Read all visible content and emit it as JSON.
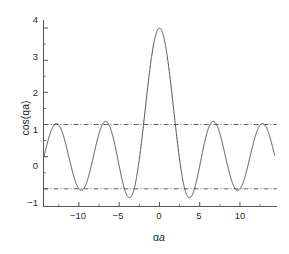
{
  "chart_data": {
    "type": "line",
    "title": "",
    "subtitle": "",
    "xlabel": "αa",
    "xlabel_symbol": "α",
    "xlabel_var": "a",
    "ylabel": "cos(qa)",
    "xlim": [
      -14.4,
      14.6
    ],
    "ylim": [
      -1.55,
      4.25
    ],
    "xticks": [
      -10,
      -5,
      0,
      5,
      10
    ],
    "xtick_labels": [
      "−10",
      "−5",
      "0",
      "5",
      "10"
    ],
    "yticks": [
      -1,
      0,
      1,
      2,
      3,
      4
    ],
    "ytick_labels": [
      "−1",
      "0",
      "1",
      "2",
      "3",
      "4"
    ],
    "minor_xticks": [
      -12.5,
      -7.5,
      -2.5,
      2.5,
      7.5,
      12.5
    ],
    "minor_yticks": [
      -0.5,
      0.5,
      1.5,
      2.5,
      3.5
    ],
    "grid": false,
    "legend": "none",
    "series": [
      {
        "name": "P sin(αa)/(αa) + cos(αa)",
        "color": "#4d4d4d",
        "linewidth": 1.0,
        "formula": "3*sin(x)/x + cos(x)",
        "P": 3,
        "x_start": -14.35,
        "x_end": 14.3,
        "samples": 1400,
        "key_points": [
          {
            "x": 0,
            "y": 4.0,
            "note": "central maximum"
          },
          {
            "x": 3.8,
            "y": -1.3,
            "note": "first minimum right"
          },
          {
            "x": -3.8,
            "y": -1.3,
            "note": "first minimum left"
          },
          {
            "x": 6.65,
            "y": 1.08,
            "note": "second maximum right"
          },
          {
            "x": -6.65,
            "y": 1.08,
            "note": "second maximum left"
          },
          {
            "x": 9.75,
            "y": -1.06,
            "note": "second minimum right"
          },
          {
            "x": -9.75,
            "y": -1.06,
            "note": "second minimum left"
          },
          {
            "x": 12.9,
            "y": 1.03,
            "note": "third maximum right"
          },
          {
            "x": -12.9,
            "y": 1.03,
            "note": "third maximum left"
          }
        ]
      }
    ],
    "reference_lines": [
      {
        "name": "upper-limit",
        "y": 1,
        "style": "dash-dot",
        "color": "#333333",
        "label": ""
      },
      {
        "name": "lower-limit",
        "y": -1,
        "style": "dash-dot",
        "color": "#333333",
        "label": ""
      }
    ],
    "axis_color": "#555555",
    "text_color": "#1e1e1e",
    "background": "#ffffff"
  },
  "axes": {
    "x_tick_labels": [
      "−10",
      "−5",
      "0",
      "5",
      "10"
    ],
    "y_tick_labels": [
      "4",
      "3",
      "2",
      "1",
      "0",
      "−1"
    ],
    "xlabel_alpha": "α",
    "xlabel_a": "a",
    "ylabel": "cos(qa)"
  }
}
